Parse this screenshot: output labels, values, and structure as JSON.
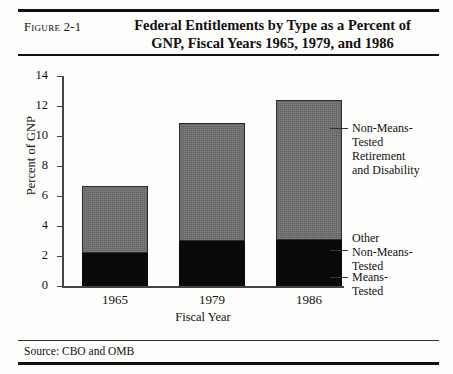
{
  "figure": {
    "label": "Figure 2-1",
    "title_line1": "Federal Entitlements by Type as a Percent of",
    "title_line2": "GNP, Fiscal Years 1965, 1979, and 1986",
    "source": "Source: CBO and OMB"
  },
  "chart_data": {
    "type": "bar",
    "stacked": true,
    "title": "Federal Entitlements by Type as a Percent of GNP, Fiscal Years 1965, 1979, and 1986",
    "xlabel": "Fiscal Year",
    "ylabel": "Percent of GNP",
    "categories": [
      "1965",
      "1979",
      "1986"
    ],
    "ylim": [
      0,
      14
    ],
    "yticks": [
      0,
      2,
      4,
      6,
      8,
      10,
      12,
      14
    ],
    "ytick_labels": [
      "0",
      "2",
      "4",
      "6",
      "8",
      "10",
      "12",
      "14"
    ],
    "grid": false,
    "legend_position": "right-inline-leader-lines",
    "series": [
      {
        "name": "Means-Tested",
        "color": "#0a0a0a",
        "values": [
          2.2,
          3.0,
          3.05
        ]
      },
      {
        "name": "Non-Means-Tested Retirement and Disability",
        "color": "#6e6e6e",
        "values": [
          4.45,
          7.85,
          9.35
        ]
      }
    ],
    "totals": [
      6.65,
      10.85,
      12.4
    ],
    "annotations": [
      "Non-Means-Tested Retirement and Disability",
      "Other Non-Means-Tested",
      "Means-Tested"
    ]
  },
  "legend": {
    "items": [
      {
        "lines": [
          "Non-Means-",
          "Tested",
          "Retirement",
          "and Disability"
        ]
      },
      {
        "lines": [
          "Other",
          "Non-Means-",
          "Tested"
        ]
      },
      {
        "lines": [
          "Means-",
          "Tested"
        ]
      }
    ]
  }
}
